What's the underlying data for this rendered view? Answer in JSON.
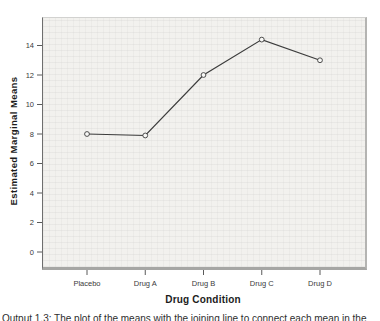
{
  "figure": {
    "caption": "Output 1.3: The plot of the means with the joining line to connect each mean in the"
  },
  "chart_data": {
    "type": "line",
    "title": "",
    "xlabel": "Drug Condition",
    "ylabel": "Estimated Marginal Means",
    "categories": [
      "Placebo",
      "Drug A",
      "Drug B",
      "Drug C",
      "Drug D"
    ],
    "values": [
      8.0,
      7.9,
      12.0,
      14.4,
      13.0
    ],
    "yticks": [
      0,
      2,
      4,
      6,
      8,
      10,
      12,
      14
    ],
    "ylim": [
      -1.0,
      15.9
    ],
    "grid": false,
    "legend": "none",
    "marker": "open-circle",
    "colors": {
      "line": "#3c3c3c",
      "marker_fill": "#f8f8f6",
      "plot_bg": "#f2f1ee",
      "axis_text": "#3a3a3a"
    }
  }
}
